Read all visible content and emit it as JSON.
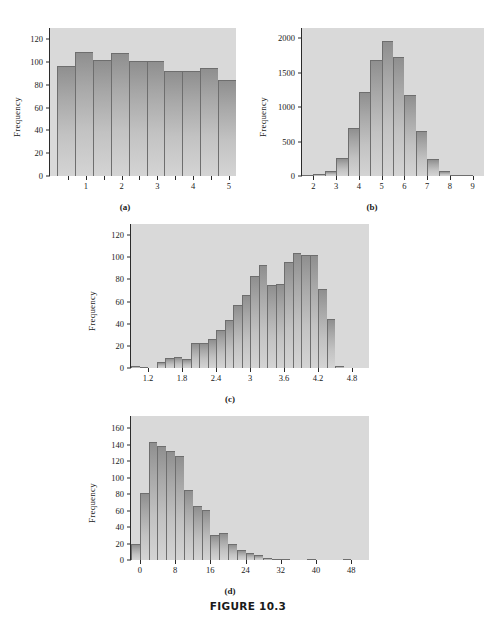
{
  "figure": {
    "caption": "FIGURE 10.3"
  },
  "panels": [
    {
      "id": "a",
      "caption": "(a)",
      "ylabel": "Frequency"
    },
    {
      "id": "b",
      "caption": "(b)",
      "ylabel": "Frequency"
    },
    {
      "id": "c",
      "caption": "(c)",
      "ylabel": "Frequency"
    },
    {
      "id": "d",
      "caption": "(d)",
      "ylabel": "Frequency"
    }
  ],
  "chart_data": [
    {
      "type": "bar",
      "panel": "a",
      "title": "(a)",
      "shape": "uniform",
      "xlabel": "",
      "ylabel": "Frequency",
      "xlim": [
        0.0,
        5.2
      ],
      "ylim": [
        0,
        130
      ],
      "yticks": [
        0,
        20,
        40,
        60,
        80,
        100,
        120
      ],
      "xticks": [
        1,
        2,
        3,
        4,
        5
      ],
      "xticks_minor": [
        0.5,
        1.5,
        2.5,
        3.5,
        4.5
      ],
      "bin_edges": [
        0.2,
        0.7,
        1.2,
        1.7,
        2.2,
        2.7,
        3.2,
        3.7,
        4.2,
        4.7,
        5.2
      ],
      "bin_width": 0.5,
      "values": [
        97,
        109,
        102,
        108,
        101,
        101,
        92,
        92,
        95,
        84
      ],
      "grid": false,
      "legend": null
    },
    {
      "type": "bar",
      "panel": "b",
      "title": "(b)",
      "shape": "bell-shaped symmetric",
      "xlabel": "",
      "ylabel": "Frequency",
      "xlim": [
        1.5,
        9.5
      ],
      "ylim": [
        0,
        2150
      ],
      "yticks": [
        0,
        500,
        1000,
        1500,
        2000
      ],
      "xticks": [
        2,
        3,
        4,
        5,
        6,
        7,
        8,
        9
      ],
      "bin_edges": [
        1.5,
        2.0,
        2.5,
        3.0,
        3.5,
        4.0,
        4.5,
        5.0,
        5.5,
        6.0,
        6.5,
        7.0,
        7.5,
        8.0,
        8.5,
        9.0,
        9.5
      ],
      "bin_width": 0.5,
      "values": [
        10,
        25,
        80,
        255,
        700,
        1215,
        1680,
        1960,
        1725,
        1175,
        655,
        245,
        75,
        10,
        3,
        0
      ],
      "grid": false,
      "legend": null
    },
    {
      "type": "bar",
      "panel": "c",
      "title": "(c)",
      "shape": "left-skewed",
      "xlabel": "",
      "ylabel": "Frequency",
      "xlim": [
        0.9,
        5.1
      ],
      "ylim": [
        0,
        130
      ],
      "yticks": [
        0,
        20,
        40,
        60,
        80,
        100,
        120
      ],
      "xticks": [
        1.2,
        1.8,
        2.4,
        3.0,
        3.6,
        4.2,
        4.8
      ],
      "bin_edges": [
        0.9,
        1.05,
        1.2,
        1.35,
        1.5,
        1.65,
        1.8,
        1.95,
        2.1,
        2.25,
        2.4,
        2.55,
        2.7,
        2.85,
        3.0,
        3.15,
        3.3,
        3.45,
        3.6,
        3.75,
        3.9,
        4.05,
        4.2,
        4.35,
        4.5,
        4.65,
        4.8,
        4.95,
        5.1
      ],
      "bin_width": 0.15,
      "values": [
        2,
        1,
        0,
        5,
        9,
        10,
        8,
        23,
        23,
        26,
        34,
        43,
        57,
        66,
        83,
        93,
        75,
        76,
        96,
        104,
        102,
        102,
        71,
        44,
        2,
        0,
        0,
        0
      ],
      "grid": false,
      "legend": null
    },
    {
      "type": "bar",
      "panel": "d",
      "title": "(d)",
      "shape": "right-skewed",
      "xlabel": "",
      "ylabel": "Frequency",
      "xlim": [
        -2,
        52
      ],
      "ylim": [
        0,
        175
      ],
      "yticks": [
        0,
        20,
        40,
        60,
        80,
        100,
        120,
        140,
        160
      ],
      "xticks": [
        0,
        8,
        16,
        24,
        32,
        40,
        48
      ],
      "bin_edges": [
        -2,
        0,
        2,
        4,
        6,
        8,
        10,
        12,
        14,
        16,
        18,
        20,
        22,
        24,
        26,
        28,
        30,
        32,
        34,
        36,
        38,
        40,
        42,
        44,
        46,
        48,
        50,
        52
      ],
      "bin_width": 2,
      "values": [
        19,
        81,
        143,
        139,
        132,
        127,
        85,
        66,
        61,
        31,
        33,
        19,
        12,
        9,
        6,
        2,
        1,
        1,
        0,
        0,
        1,
        0,
        0,
        0,
        1,
        0,
        0
      ],
      "grid": false,
      "legend": null
    }
  ]
}
